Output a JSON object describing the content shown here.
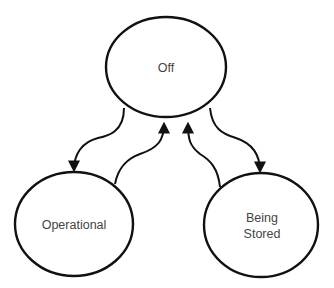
{
  "diagram": {
    "type": "state-diagram",
    "stroke_color": "#111111",
    "text_color": "#444444",
    "background": "#ffffff",
    "states": [
      {
        "id": "off",
        "label_lines": [
          "Off"
        ]
      },
      {
        "id": "operational",
        "label_lines": [
          "Operational"
        ]
      },
      {
        "id": "being_stored",
        "label_lines": [
          "Being",
          "Stored"
        ]
      }
    ],
    "transitions": [
      {
        "from": "off",
        "to": "operational"
      },
      {
        "from": "operational",
        "to": "off"
      },
      {
        "from": "off",
        "to": "being_stored"
      },
      {
        "from": "being_stored",
        "to": "off"
      }
    ]
  }
}
